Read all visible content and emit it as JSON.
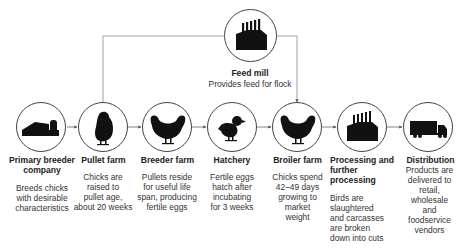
{
  "diagram": {
    "type": "flowchart",
    "colors": {
      "line": "#777777",
      "circle_border": "#444444",
      "icon_fill": "#111111",
      "text": "#222222"
    },
    "feed_mill": {
      "title": "Feed mill",
      "description": "Provides feed for flock",
      "icon": "factory-icon",
      "feeds_into": [
        "Pullet farm",
        "Broiler farm"
      ]
    },
    "stages": [
      {
        "title_lines": [
          "Primary breeder",
          "company"
        ],
        "description_lines": [
          "Breeds chicks",
          "with desirable",
          "characteristics"
        ],
        "icon": "barn-silo-icon"
      },
      {
        "title_lines": [
          "Pullet farm"
        ],
        "description_lines": [
          "Chicks are",
          "raised to",
          "pullet age,",
          "about 20 weeks"
        ],
        "icon": "pullet-icon"
      },
      {
        "title_lines": [
          "Breeder farm"
        ],
        "description_lines": [
          "Pullets reside",
          "for useful life",
          "span, producing",
          "fertile eggs"
        ],
        "icon": "hen-icon"
      },
      {
        "title_lines": [
          "Hatchery"
        ],
        "description_lines": [
          "Fertile eggs",
          "hatch after",
          "incubating",
          "for 3 weeks"
        ],
        "icon": "chick-icon"
      },
      {
        "title_lines": [
          "Broiler farm"
        ],
        "description_lines": [
          "Chicks spend",
          "42–49 days",
          "growing to",
          "market",
          "weight"
        ],
        "icon": "broiler-icon"
      },
      {
        "title_lines": [
          "Processing and",
          "further",
          "processing"
        ],
        "description_lines": [
          "Birds are",
          "slaughtered",
          "and carcasses",
          "are broken",
          "down into cuts"
        ],
        "icon": "factory-icon"
      },
      {
        "title_lines": [
          "Distribution"
        ],
        "description_lines": [
          "Products are",
          "delivered to",
          "retail,",
          "wholesale",
          "and",
          "foodservice",
          "vendors"
        ],
        "icon": "truck-icon"
      }
    ]
  }
}
